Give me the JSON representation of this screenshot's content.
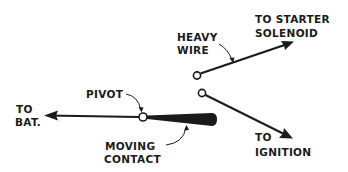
{
  "diagram": {
    "type": "switch-schematic",
    "colors": {
      "ink": "#1a1a1a",
      "background": "#ffffff"
    },
    "labels": {
      "to_bat_line1": "TO",
      "to_bat_line2": "BAT.",
      "pivot": "PIVOT",
      "heavy_wire_line1": "HEAVY",
      "heavy_wire_line2": "WIRE",
      "to_starter_line1": "TO STARTER",
      "to_starter_line2": "SOLENOID",
      "moving_contact_line1": "MOVING",
      "moving_contact_line2": "CONTACT",
      "to_ignition_line1": "TO",
      "to_ignition_line2": "IGNITION"
    },
    "nodes": [
      {
        "id": "pivot",
        "label": "PIVOT"
      },
      {
        "id": "starter-terminal",
        "label": "TO STARTER SOLENOID"
      },
      {
        "id": "ignition-terminal",
        "label": "TO IGNITION"
      },
      {
        "id": "battery",
        "label": "TO BAT."
      }
    ],
    "edges": [
      {
        "from": "pivot",
        "to": "battery",
        "style": "arrow"
      },
      {
        "from": "starter-terminal",
        "to": "starter-solenoid",
        "style": "heavy-wire-arrow"
      },
      {
        "from": "ignition-terminal",
        "to": "ignition",
        "style": "arrow"
      },
      {
        "from": "pivot",
        "to": "moving-contact",
        "style": "tapered-bar"
      }
    ]
  }
}
